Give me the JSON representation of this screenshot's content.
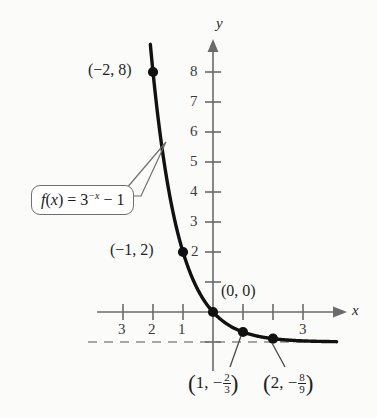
{
  "figure": {
    "background_color": "#fbfbfa",
    "curve_color": "#111111",
    "axis_color": "#6b6b6b",
    "asymptote_color": "#8a8a8a"
  },
  "axes": {
    "x_axis_name": "x",
    "y_axis_name": "y",
    "y_tick_labels": [
      "8",
      "7",
      "6",
      "5",
      "4",
      "3",
      "2"
    ],
    "x_tick_labels_left": [
      "3",
      "2",
      "1"
    ],
    "x_tick_labels_right": [
      "3"
    ]
  },
  "callout": {
    "prefix": "f",
    "open_paren": "(",
    "variable": "x",
    "close_paren": ")",
    "equals": "=",
    "base": "3",
    "exponent": "−x",
    "tail": "− 1",
    "full_text": "f(x) = 3−x − 1"
  },
  "point_labels": {
    "p_neg2_8": "(−2, 8)",
    "p_neg1_2": "(−1, 2)",
    "p_0_0": "(0, 0)",
    "p_1": {
      "open": "(",
      "x": "1,",
      "sign": "−",
      "num": "2",
      "den": "3",
      "close": ")"
    },
    "p_2": {
      "open": "(",
      "x": "2,",
      "sign": "−",
      "num": "8",
      "den": "9",
      "close": ")"
    }
  },
  "chart_data": {
    "type": "line",
    "title": "",
    "xlabel": "x",
    "ylabel": "y",
    "function": "f(x) = 3^(-x) - 1",
    "xlim": [
      -3.6,
      4.2
    ],
    "ylim": [
      -1.6,
      8.8
    ],
    "grid": false,
    "legend": "none",
    "asymptote": {
      "type": "horizontal",
      "y": -1,
      "style": "dashed"
    },
    "x_ticks": [
      -3,
      -2,
      -1,
      1,
      2,
      3
    ],
    "x_tick_display": [
      "3",
      "2",
      "1",
      "",
      "",
      "3"
    ],
    "y_ticks": [
      1,
      2,
      3,
      4,
      5,
      6,
      7,
      8
    ],
    "y_tick_display": [
      "",
      "2",
      "3",
      "4",
      "5",
      "6",
      "7",
      "8"
    ],
    "marked_points": [
      {
        "x": -2,
        "y": 8,
        "label": "(−2, 8)"
      },
      {
        "x": -1,
        "y": 2,
        "label": "(−1, 2)"
      },
      {
        "x": 0,
        "y": 0,
        "label": "(0, 0)"
      },
      {
        "x": 1,
        "y": -0.6667,
        "label": "(1, −2/3)"
      },
      {
        "x": 2,
        "y": -0.8889,
        "label": "(2, −8/9)"
      }
    ],
    "series": [
      {
        "name": "f(x) = 3^(-x) - 1",
        "x": [
          -2.1,
          -2,
          -1.75,
          -1.5,
          -1.25,
          -1,
          -0.75,
          -0.5,
          -0.25,
          0,
          0.25,
          0.5,
          0.75,
          1,
          1.25,
          1.5,
          2,
          2.5,
          3,
          3.5,
          4
        ],
        "y": [
          9.03,
          8.0,
          5.84,
          4.196,
          2.947,
          2.0,
          1.279,
          0.732,
          0.316,
          0.0,
          -0.24,
          -0.423,
          -0.561,
          -0.667,
          -0.747,
          -0.808,
          -0.889,
          -0.936,
          -0.963,
          -0.979,
          -0.988
        ]
      }
    ]
  }
}
